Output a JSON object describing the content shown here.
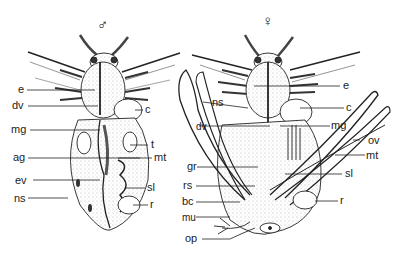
{
  "figure": {
    "male": {
      "symbol": "♂",
      "labels": {
        "e": "e",
        "dv": "dv",
        "c": "c",
        "mg": "mg",
        "t": "t",
        "ag": "ag",
        "mt": "mt",
        "ev": "ev",
        "sl": "sl",
        "ns": "ns",
        "r": "r"
      }
    },
    "female": {
      "symbol": "♀",
      "labels": {
        "e": "e",
        "ns": "ns",
        "c": "c",
        "dv": "dv",
        "mg": "mg",
        "ov": "ov",
        "mt": "mt",
        "gr": "gr",
        "sl": "sl",
        "rs": "rs",
        "bc": "bc",
        "r": "r",
        "mu": "mu",
        "op": "op"
      }
    }
  }
}
